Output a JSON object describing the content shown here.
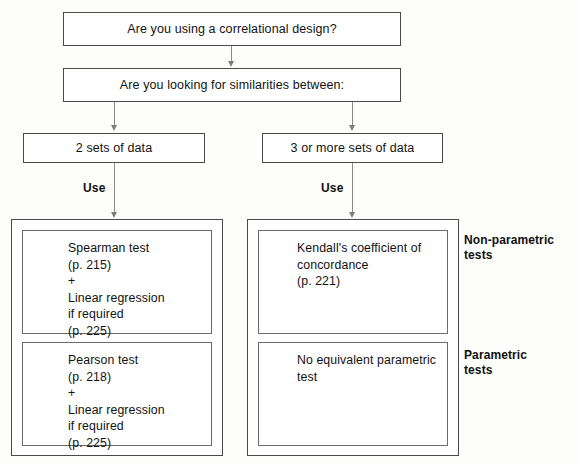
{
  "diagram": {
    "type": "flowchart",
    "colors": {
      "box_border": "#4a4a4a",
      "inner_border": "#6a6a6a",
      "connector": "#8a8a8a",
      "text": "#121212",
      "background": "#fdfdfc"
    },
    "questions": [
      {
        "id": "q1",
        "text": "Are you using a correlational design?"
      },
      {
        "id": "q2",
        "text": "Are you looking for similarities between:"
      }
    ],
    "branches": [
      {
        "id": "left",
        "text": "2 sets of data",
        "connector_label": "Use"
      },
      {
        "id": "right",
        "text": "3 or more sets of data",
        "connector_label": "Use"
      }
    ],
    "results": {
      "left": {
        "non_parametric": "Spearman test\n(p. 215)\n+\nLinear regression\nif required\n(p. 225)",
        "parametric": "Pearson test\n(p. 218)\n+\nLinear regression\nif required\n(p. 225)"
      },
      "right": {
        "non_parametric": "Kendall's coefficient of\nconcordance\n(p. 221)",
        "parametric": "No equivalent parametric\ntest"
      }
    },
    "side_labels": {
      "non_parametric": "Non-parametric\ntests",
      "parametric": "Parametric\ntests"
    }
  }
}
